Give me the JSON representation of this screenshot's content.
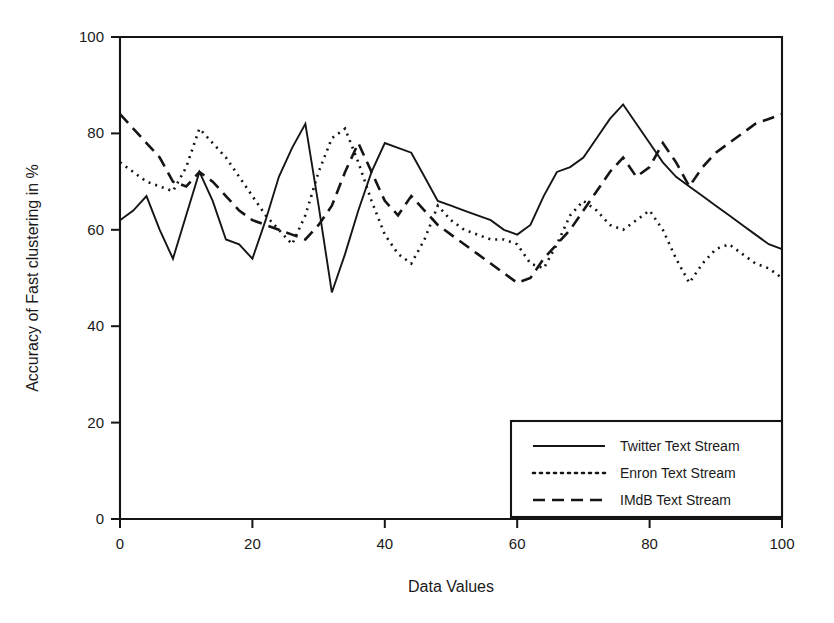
{
  "chart_data": {
    "type": "line",
    "title": "",
    "xlabel": "Data Values",
    "ylabel": "Accuracy of Fast clustering in %",
    "xlim": [
      0,
      100
    ],
    "ylim": [
      0,
      100
    ],
    "xticks": [
      0,
      20,
      40,
      60,
      80,
      100
    ],
    "yticks": [
      0,
      20,
      40,
      60,
      80,
      100
    ],
    "xtick_labels": [
      "0",
      "20",
      "40",
      "60",
      "80",
      "100"
    ],
    "ytick_labels": [
      "0",
      "20",
      "40",
      "60",
      "80",
      "100"
    ],
    "grid": false,
    "legend_position": "lower right",
    "line_color": "#151515",
    "background": "#ffffff",
    "x": [
      0,
      2,
      4,
      6,
      8,
      10,
      12,
      14,
      16,
      18,
      20,
      22,
      24,
      26,
      28,
      30,
      32,
      34,
      36,
      38,
      40,
      42,
      44,
      46,
      48,
      50,
      52,
      54,
      56,
      58,
      60,
      62,
      64,
      66,
      68,
      70,
      72,
      74,
      76,
      78,
      80,
      82,
      84,
      86,
      88,
      90,
      92,
      94,
      96,
      98,
      100
    ],
    "series": [
      {
        "name": "Twitter Text Stream",
        "style": "solid",
        "dash": "none",
        "values": [
          62,
          64,
          67,
          60,
          54,
          63,
          72,
          66,
          58,
          57,
          54,
          62,
          71,
          77,
          82,
          65,
          47,
          55,
          64,
          72,
          78,
          77,
          76,
          71,
          66,
          65,
          64,
          63,
          62,
          60,
          59,
          61,
          67,
          72,
          73,
          75,
          79,
          83,
          86,
          82,
          78,
          74,
          71,
          69,
          67,
          65,
          63,
          61,
          59,
          57,
          56
        ]
      },
      {
        "name": "Enron Text Stream",
        "style": "dotted",
        "dash": "2,5",
        "values": [
          74,
          72,
          70,
          69,
          68,
          73,
          81,
          78,
          75,
          71,
          67,
          63,
          60,
          57,
          63,
          72,
          79,
          81,
          74,
          66,
          59,
          55,
          53,
          58,
          65,
          62,
          60,
          59,
          58,
          58,
          57,
          53,
          52,
          57,
          63,
          66,
          64,
          61,
          60,
          62,
          64,
          60,
          54,
          49,
          53,
          56,
          57,
          55,
          53,
          52,
          50
        ]
      },
      {
        "name": "IMdB Text Stream",
        "style": "dashed",
        "dash": "12,7",
        "values": [
          84,
          81,
          78,
          75,
          70,
          69,
          72,
          70,
          67,
          64,
          62,
          61,
          60,
          59,
          58,
          61,
          65,
          72,
          78,
          72,
          66,
          63,
          67,
          64,
          61,
          59,
          57,
          55,
          53,
          51,
          49,
          50,
          54,
          57,
          60,
          64,
          68,
          72,
          75,
          71,
          73,
          78,
          74,
          69,
          73,
          76,
          78,
          80,
          82,
          83,
          84
        ]
      }
    ]
  },
  "axes": {
    "x_title": "Data Values",
    "y_title": "Accuracy of Fast clustering in %"
  },
  "legend": {
    "entries": [
      {
        "label": "Twitter Text Stream",
        "style": "solid"
      },
      {
        "label": "Enron Text Stream",
        "style": "dotted"
      },
      {
        "label": "IMdB Text Stream",
        "style": "dashed"
      }
    ]
  }
}
